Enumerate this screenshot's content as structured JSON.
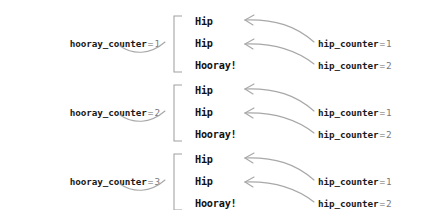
{
  "figure": {
    "type": "nested-loop-trace-diagram",
    "background_color": "#ffffff",
    "text_color": "#111111",
    "muted_color": "#777777",
    "line_color": "#9e9e9e"
  },
  "groups": [
    {
      "outer": {
        "varname": "hooray_counter",
        "eq": "=",
        "value": "1"
      },
      "lines": [
        {
          "text": "Hip"
        },
        {
          "text": "Hip"
        },
        {
          "text": "Hooray!"
        }
      ],
      "inner": [
        {
          "varname": "hip_counter",
          "eq": "=",
          "value": "1"
        },
        {
          "varname": "hip_counter",
          "eq": "=",
          "value": "2"
        }
      ]
    },
    {
      "outer": {
        "varname": "hooray_counter",
        "eq": "=",
        "value": "2"
      },
      "lines": [
        {
          "text": "Hip"
        },
        {
          "text": "Hip"
        },
        {
          "text": "Hooray!"
        }
      ],
      "inner": [
        {
          "varname": "hip_counter",
          "eq": "=",
          "value": "1"
        },
        {
          "varname": "hip_counter",
          "eq": "=",
          "value": "2"
        }
      ]
    },
    {
      "outer": {
        "varname": "hooray_counter",
        "eq": "=",
        "value": "3"
      },
      "lines": [
        {
          "text": "Hip"
        },
        {
          "text": "Hip"
        },
        {
          "text": "Hooray!"
        }
      ],
      "inner": [
        {
          "varname": "hip_counter",
          "eq": "=",
          "value": "1"
        },
        {
          "varname": "hip_counter",
          "eq": "=",
          "value": "2"
        }
      ]
    }
  ]
}
